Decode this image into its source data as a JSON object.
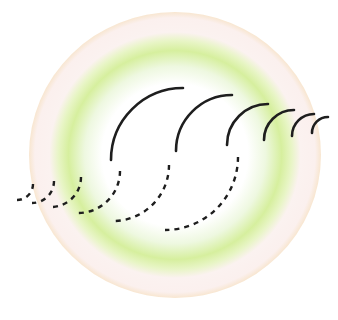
{
  "diagram": {
    "background": "#ffffff",
    "halo": {
      "cx": 175,
      "cy": 155,
      "rx": 146,
      "ry": 143,
      "stops": [
        {
          "offset": "0%",
          "color": "#ffffff"
        },
        {
          "offset": "50%",
          "color": "#ffffff"
        },
        {
          "offset": "62%",
          "color": "#eef8e0"
        },
        {
          "offset": "73%",
          "color": "#d6ef9e"
        },
        {
          "offset": "80%",
          "color": "#e8f5c6"
        },
        {
          "offset": "86%",
          "color": "#fbf2f0"
        },
        {
          "offset": "96%",
          "color": "#fbf0ee"
        },
        {
          "offset": "100%",
          "color": "#f8e6d0"
        }
      ]
    },
    "stroke_color": "#1e1e1e",
    "solid_arcs": [
      {
        "cx": 183,
        "cy": 160,
        "r": 72,
        "width": 2.6
      },
      {
        "cx": 232,
        "cy": 151,
        "r": 56,
        "width": 2.6
      },
      {
        "cx": 268,
        "cy": 145,
        "r": 41,
        "width": 2.6
      },
      {
        "cx": 294,
        "cy": 140,
        "r": 30,
        "width": 2.6
      },
      {
        "cx": 314,
        "cy": 136,
        "r": 22,
        "width": 2.6
      },
      {
        "cx": 328,
        "cy": 133,
        "r": 16,
        "width": 2.6
      }
    ],
    "dashed_arcs": [
      {
        "cx": 165,
        "cy": 157,
        "r": 73,
        "width": 2.4
      },
      {
        "cx": 113,
        "cy": 165,
        "r": 56,
        "width": 2.4
      },
      {
        "cx": 78,
        "cy": 171,
        "r": 42,
        "width": 2.4
      },
      {
        "cx": 51,
        "cy": 177,
        "r": 30,
        "width": 2.4
      },
      {
        "cx": 32,
        "cy": 181,
        "r": 22,
        "width": 2.4
      },
      {
        "cx": 17,
        "cy": 184,
        "r": 16,
        "width": 2.4
      }
    ],
    "dash_pattern": "5 5"
  }
}
